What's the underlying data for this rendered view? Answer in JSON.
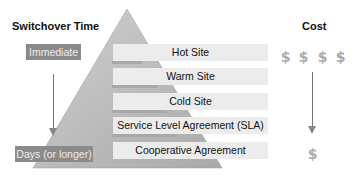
{
  "headers": {
    "switchover": "Switchover Time",
    "cost": "Cost"
  },
  "switchover_labels": {
    "top": "Immediate",
    "bottom": "Days (or longer)"
  },
  "tiers": [
    {
      "label": "Hot Site"
    },
    {
      "label": "Warm Site"
    },
    {
      "label": "Cold Site"
    },
    {
      "label": "Service Level Agreement (SLA)"
    },
    {
      "label": "Cooperative Agreement"
    }
  ],
  "cost_icons": {
    "top_count": 4,
    "bottom_count": 1,
    "glyph": "$",
    "icon": "money-bag-icon"
  },
  "colors": {
    "pyramid": "#bdbdbd",
    "label_bg": "#8a8a8a",
    "tier_bg": "#ececec"
  }
}
